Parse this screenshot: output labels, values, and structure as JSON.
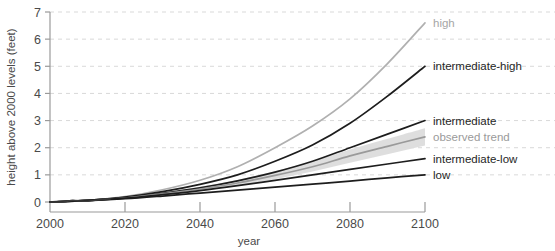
{
  "chart_data": {
    "type": "line",
    "title": "",
    "xlabel": "year",
    "ylabel": "height above 2000 levels (feet)",
    "xlim": [
      2000,
      2100
    ],
    "ylim": [
      0,
      7
    ],
    "grid": true,
    "legend_position": "right-inline",
    "x_ticks": [
      "2000",
      "2020",
      "2040",
      "2060",
      "2080",
      "2100"
    ],
    "y_ticks": [
      "0",
      "1",
      "2",
      "3",
      "4",
      "5",
      "6",
      "7"
    ],
    "x": [
      2000,
      2010,
      2020,
      2030,
      2040,
      2050,
      2060,
      2070,
      2080,
      2090,
      2100
    ],
    "series": [
      {
        "name": "high",
        "color": "#b0b0b0",
        "label_color": "#a6a6a6",
        "values": [
          0,
          0.06,
          0.2,
          0.45,
          0.8,
          1.3,
          2.0,
          2.8,
          3.8,
          5.1,
          6.6
        ]
      },
      {
        "name": "intermediate-high",
        "color": "#1d1d1d",
        "label_color": "#262626",
        "values": [
          0,
          0.06,
          0.18,
          0.38,
          0.65,
          1.0,
          1.5,
          2.1,
          2.9,
          3.9,
          5.0
        ]
      },
      {
        "name": "intermediate",
        "color": "#1d1d1d",
        "label_color": "#262626",
        "values": [
          0,
          0.06,
          0.16,
          0.32,
          0.52,
          0.78,
          1.1,
          1.5,
          2.0,
          2.5,
          3.0
        ]
      },
      {
        "name": "observed trend",
        "color": "#9a9a9a",
        "label_color": "#9a9a9a",
        "band_color": "#dcdcdc",
        "values": [
          0,
          0.06,
          0.15,
          0.3,
          0.48,
          0.7,
          0.98,
          1.3,
          1.7,
          2.05,
          2.4
        ],
        "band_low": [
          0,
          0.05,
          0.13,
          0.26,
          0.41,
          0.6,
          0.84,
          1.12,
          1.45,
          1.76,
          2.08
        ],
        "band_high": [
          0,
          0.07,
          0.18,
          0.35,
          0.56,
          0.81,
          1.13,
          1.5,
          1.93,
          2.33,
          2.72
        ]
      },
      {
        "name": "intermediate-low",
        "color": "#1d1d1d",
        "label_color": "#262626",
        "values": [
          0,
          0.06,
          0.14,
          0.27,
          0.42,
          0.6,
          0.8,
          1.0,
          1.2,
          1.4,
          1.6
        ]
      },
      {
        "name": "low",
        "color": "#1d1d1d",
        "label_color": "#262626",
        "values": [
          0,
          0.05,
          0.12,
          0.22,
          0.33,
          0.44,
          0.55,
          0.66,
          0.77,
          0.89,
          1.0
        ]
      }
    ],
    "historical": {
      "name": "historical observations",
      "color": "#3a3a3a",
      "x": [
        2000,
        2002,
        2004,
        2006,
        2008,
        2010,
        2012,
        2014,
        2016
      ],
      "values": [
        0.0,
        0.0,
        0.01,
        0.06,
        0.04,
        0.03,
        0.06,
        0.09,
        0.11
      ]
    },
    "colors": {
      "axis": "#9a9a9a",
      "grid": "#d9d9d9",
      "text": "#4a4a4a",
      "dark_line": "#1d1d1d",
      "gray_line": "#b0b0b0",
      "band": "#dcdcdc"
    }
  },
  "legend_labels": {
    "high": "high",
    "intermediate_high": "intermediate-high",
    "intermediate": "intermediate",
    "observed_trend": "observed trend",
    "intermediate_low": "intermediate-low",
    "low": "low"
  }
}
